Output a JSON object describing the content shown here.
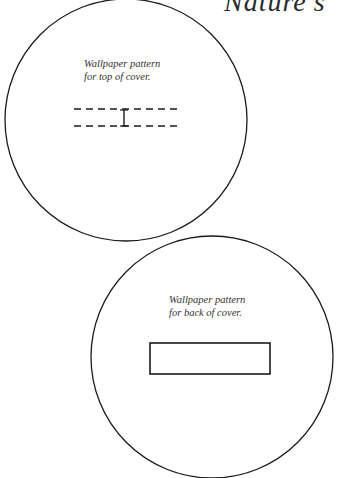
{
  "page": {
    "heading": "Nature's"
  },
  "top_cover": {
    "label_line1": "Wallpaper pattern",
    "label_line2": "for top of cover.",
    "cut_mark": "dashed-slot-with-I-marker"
  },
  "back_cover": {
    "label_line1": "Wallpaper pattern",
    "label_line2": "for back of cover.",
    "cut_mark": "solid-rectangle-slot"
  },
  "colors": {
    "stroke": "#1a1a1a",
    "background": "#ffffff"
  }
}
